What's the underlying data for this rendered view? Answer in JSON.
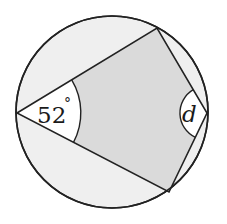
{
  "diagram": {
    "type": "cyclic-quadrilateral",
    "colors": {
      "background": "#ffffff",
      "circle_fill": "#efefef",
      "quad_fill": "#dadada",
      "angle_sector_fill": "#ffffff",
      "stroke": "#222222"
    },
    "circle": {
      "cx": 112,
      "cy": 112,
      "r": 96
    },
    "vertices": {
      "left": {
        "x": 17,
        "y": 113
      },
      "top": {
        "x": 157,
        "y": 28
      },
      "right": {
        "x": 207,
        "y": 113
      },
      "bottom": {
        "x": 169,
        "y": 192
      }
    },
    "angles": {
      "left": {
        "value": "52°",
        "number": "52",
        "unit": "°"
      },
      "right": {
        "label": "d"
      }
    }
  }
}
